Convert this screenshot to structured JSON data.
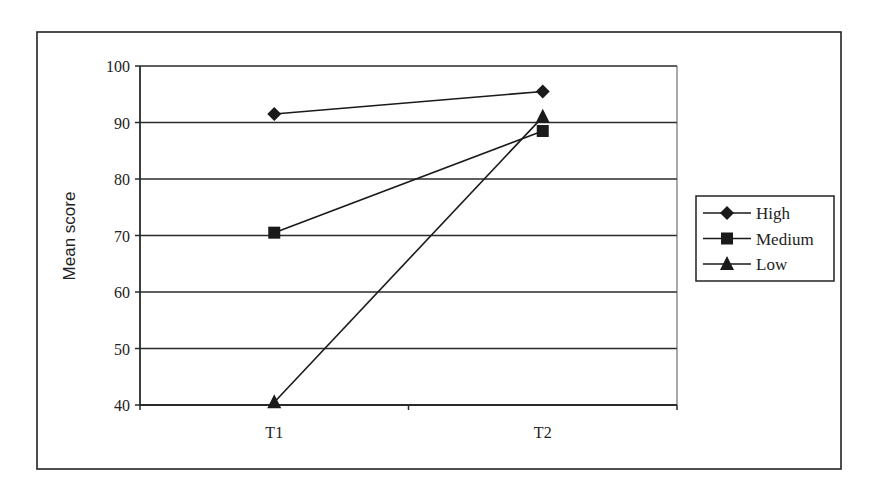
{
  "chart_data": {
    "type": "line",
    "title": "",
    "xlabel": "",
    "ylabel": "Mean score",
    "categories": [
      "T1",
      "T2"
    ],
    "ylim": [
      40,
      100
    ],
    "yticks": [
      40,
      50,
      60,
      70,
      80,
      90,
      100
    ],
    "grid": true,
    "legend_position": "right",
    "series": [
      {
        "name": "High",
        "marker": "diamond",
        "values": [
          91.5,
          95.5
        ]
      },
      {
        "name": "Medium",
        "marker": "square",
        "values": [
          70.5,
          88.5
        ]
      },
      {
        "name": "Low",
        "marker": "triangle",
        "values": [
          40.5,
          91
        ]
      }
    ]
  },
  "colors": {
    "line": "#1a1a1a",
    "grid": "#2a2a2a",
    "frame": "#222222",
    "text": "#222222"
  }
}
